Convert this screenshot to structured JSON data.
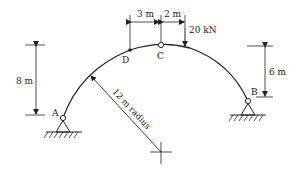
{
  "diagram": {
    "type": "three-hinged circular arch",
    "labels": {
      "support_a": "A",
      "support_b": "B",
      "crown_hinge": "C",
      "point_d": "D"
    },
    "dimensions": {
      "dc_horizontal": "3 m",
      "c_to_load": "2 m",
      "left_height": "8 m",
      "right_height": "6 m",
      "radius": "12 m radius"
    },
    "load": {
      "value": "20 kN"
    },
    "colors": {
      "line": "#222222",
      "background": "#ffffff"
    }
  }
}
